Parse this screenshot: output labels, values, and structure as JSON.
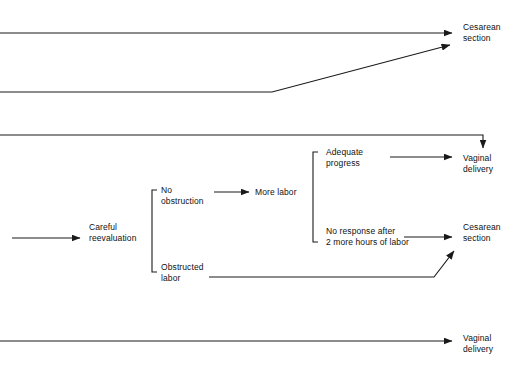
{
  "diagram": {
    "type": "flowchart",
    "background_color": "#ffffff",
    "line_color": "#1a1a1a",
    "text_color": "#111111",
    "nodes": [
      {
        "id": "cesarean_top",
        "label": "Cesarean\nsection",
        "x": 463,
        "y": 22
      },
      {
        "id": "vaginal_upper",
        "label": "Vaginal\ndelivery",
        "x": 463,
        "y": 153
      },
      {
        "id": "careful_reevaluation",
        "label": "Careful\nreevaluation",
        "x": 89,
        "y": 222
      },
      {
        "id": "no_obstruction",
        "label": "No\nobstruction",
        "x": 161,
        "y": 185
      },
      {
        "id": "more_labor",
        "label": "More labor",
        "x": 255,
        "y": 192
      },
      {
        "id": "obstructed_labor",
        "label": "Obstructed\nlabor",
        "x": 161,
        "y": 262
      },
      {
        "id": "adequate_progress",
        "label": "Adequate\nprogress",
        "x": 326,
        "y": 147
      },
      {
        "id": "no_response",
        "label": "No response after\n2 more hours of labor",
        "x": 326,
        "y": 226
      },
      {
        "id": "cesarean_middle",
        "label": "Cesarean\nsection",
        "x": 463,
        "y": 222
      },
      {
        "id": "vaginal_lower",
        "label": "Vaginal\ndelivery",
        "x": 463,
        "y": 333
      }
    ],
    "connectors": [
      {
        "id": "top-line-to-cesarean",
        "kind": "arrow-horizontal",
        "from": "left-edge",
        "to": "cesarean_top",
        "points": "0,33 455,33"
      },
      {
        "id": "second-line-diagonal-to-cesarean",
        "kind": "arrow-polyline",
        "from": "left-edge",
        "to": "cesarean_top",
        "points": "0,92 272,92 453,44"
      },
      {
        "id": "third-line-down-to-vaginal",
        "kind": "arrow-polyline-down",
        "from": "left-edge",
        "to": "vaginal_upper",
        "points": "0,135 483,135 483,150"
      },
      {
        "id": "left-edge-to-careful-reevaluation",
        "kind": "arrow-horizontal",
        "from": "left-edge",
        "to": "careful_reevaluation",
        "points": "12,238 82,238"
      },
      {
        "id": "reevaluation-bracket",
        "kind": "bracket",
        "from": "careful_reevaluation",
        "to": "no_obstruction,obstructed_labor",
        "x": 152,
        "top": 190,
        "bottom": 272,
        "tick": 5
      },
      {
        "id": "no-obstruction-to-more-labor",
        "kind": "arrow-horizontal",
        "from": "no_obstruction",
        "to": "more_labor",
        "points": "214,192 250,192"
      },
      {
        "id": "more-labor-bracket",
        "kind": "bracket",
        "from": "more_labor",
        "to": "adequate_progress,no_response",
        "x": 313,
        "top": 152,
        "bottom": 242,
        "tick": 5
      },
      {
        "id": "adequate-progress-to-vaginal",
        "kind": "arrow-horizontal",
        "from": "adequate_progress",
        "to": "vaginal_upper",
        "points": "390,157 455,157"
      },
      {
        "id": "no-response-to-cesarean",
        "kind": "arrow-horizontal",
        "from": "no_response",
        "to": "cesarean_middle",
        "points": "404,237 455,237"
      },
      {
        "id": "obstructed-labor-to-cesarean",
        "kind": "arrow-polyline",
        "from": "obstructed_labor",
        "to": "cesarean_middle",
        "points": "209,277 434,277 456,249"
      },
      {
        "id": "bottom-line-to-vaginal",
        "kind": "arrow-horizontal",
        "from": "left-edge",
        "to": "vaginal_lower",
        "points": "0,341 455,341"
      }
    ]
  }
}
